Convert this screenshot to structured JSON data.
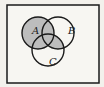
{
  "diagram": {
    "type": "venn",
    "sets": [
      {
        "label": "A",
        "cx": 38,
        "cy": 33,
        "r": 16
      },
      {
        "label": "B",
        "cx": 58,
        "cy": 33,
        "r": 16
      },
      {
        "label": "C",
        "cx": 48,
        "cy": 50,
        "r": 16
      }
    ],
    "shaded_region": "A ∪ (B ∩ C)",
    "colors": {
      "background": "#f3f1ec",
      "shade": "#bdbdbd",
      "stroke": "#1a1a1a"
    }
  },
  "labels": {
    "A": "A",
    "B": "B",
    "C": "C"
  }
}
